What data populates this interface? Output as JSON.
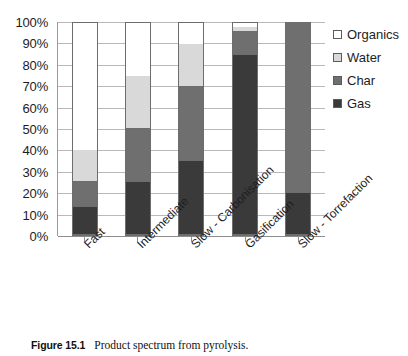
{
  "chart_data": {
    "type": "bar",
    "subtype": "stacked-100-percent",
    "title": "",
    "xlabel": "",
    "ylabel": "",
    "ylim": [
      0,
      100
    ],
    "ytick_labels": [
      "100%",
      "90%",
      "80%",
      "70%",
      "60%",
      "50%",
      "40%",
      "30%",
      "20%",
      "10%",
      "0%"
    ],
    "ytick_values": [
      100,
      90,
      80,
      70,
      60,
      50,
      40,
      30,
      20,
      10,
      0
    ],
    "grid": true,
    "legend_position": "right-top",
    "categories": [
      "Fast",
      "Intermediate",
      "Slow - Carbonisation",
      "Gasification",
      "Slow - Torrefaction"
    ],
    "series": [
      {
        "name": "Gas",
        "color": "#3a3a3a",
        "values": [
          13,
          25,
          35,
          85,
          20
        ]
      },
      {
        "name": "Char",
        "color": "#6f6f6f",
        "values": [
          12,
          25,
          35,
          11,
          80
        ]
      },
      {
        "name": "Water",
        "color": "#d9d9d9",
        "values": [
          15,
          25,
          20,
          2,
          0
        ]
      },
      {
        "name": "Organics",
        "color": "#ffffff",
        "values": [
          60,
          25,
          10,
          2,
          0
        ]
      }
    ],
    "stack_order_bottom_to_top": [
      "Gas",
      "Char",
      "Water",
      "Organics"
    ]
  },
  "legend": {
    "items": [
      {
        "label": "Organics",
        "color": "#ffffff"
      },
      {
        "label": "Water",
        "color": "#d9d9d9"
      },
      {
        "label": "Char",
        "color": "#6f6f6f"
      },
      {
        "label": "Gas",
        "color": "#3a3a3a"
      }
    ]
  },
  "caption": {
    "label": "Figure 15.1",
    "text": "Product spectrum from pyrolysis."
  }
}
